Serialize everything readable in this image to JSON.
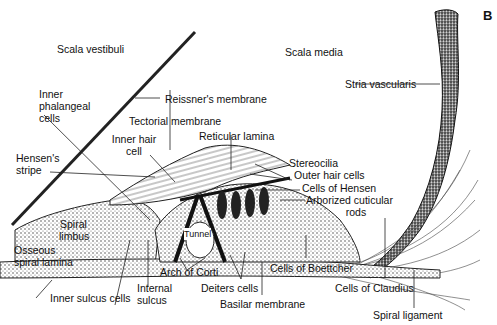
{
  "figure": {
    "panel_letter": "B"
  },
  "labels": {
    "scala_vestibuli": "Scala vestibuli",
    "scala_media": "Scala media",
    "stria_vascularis": "Stria vascularis",
    "reissners_membrane": "Reissner's membrane",
    "inner_phalangeal_cells": [
      "Inner",
      "phalangeal",
      "cells"
    ],
    "tectorial_membrane": "Tectorial membrane",
    "inner_hair_cell": [
      "Inner hair",
      "cell"
    ],
    "reticular_lamina": "Reticular lamina",
    "hensens_stripe": [
      "Hensen's",
      "stripe"
    ],
    "stereocilia": "Stereocilia",
    "outer_hair_cells": "Outer hair cells",
    "cells_of_hensen": "Cells of Hensen",
    "arborized_cuticular_rods": [
      "Arborized cuticular",
      "rods"
    ],
    "spiral_limbus": [
      "Spiral",
      "limbus"
    ],
    "tunnel": "Tunnel",
    "osseous_spiral_lamina": [
      "Osseous",
      "spiral lamina"
    ],
    "arch_of_corti": "Arch of Corti",
    "cells_of_boettcher": "Cells of Boettcher",
    "internal_sulcus": [
      "Internal",
      "sulcus"
    ],
    "deiters_cells": "Deiters cells",
    "cells_of_claudius": "Cells of Claudius",
    "inner_sulcus_cells": "Inner sulcus cells",
    "basilar_membrane": "Basilar membrane",
    "spiral_ligament": "Spiral ligament"
  }
}
